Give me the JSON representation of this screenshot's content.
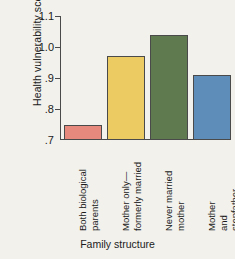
{
  "chart_data": {
    "type": "bar",
    "title": "",
    "xlabel": "Family structure",
    "ylabel": "Health vulnerability score",
    "categories": [
      "Both biological\nparents",
      "Mother only—\nformerly married",
      "Never married\nmother",
      "Mother and\nstepfather"
    ],
    "values": [
      0.75,
      0.97,
      1.04,
      0.91
    ],
    "ylim": [
      0.7,
      1.1
    ],
    "yticks": [
      0.7,
      0.8,
      0.9,
      1.0,
      1.1
    ],
    "ytick_labels": [
      ".7",
      ".8",
      ".9",
      "1.0",
      "1.1"
    ],
    "grid": false,
    "legend": null,
    "bar_colors": [
      "#e8897e",
      "#eccb63",
      "#5f7a4e",
      "#5e8dba"
    ],
    "bar_edge_color": "#4a4a4a",
    "axis_color": "#4a4a4a",
    "background_color": "#f2f1ec",
    "text_color": "#1b1b1b"
  }
}
